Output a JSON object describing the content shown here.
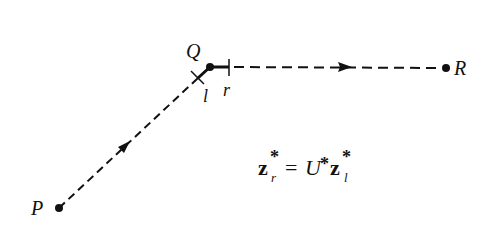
{
  "diagram": {
    "points": {
      "P": {
        "label": "P",
        "x": 59,
        "y": 208
      },
      "Q": {
        "label": "Q",
        "x": 210,
        "y": 67
      },
      "R": {
        "label": "R",
        "x": 446,
        "y": 68
      }
    },
    "marks": {
      "l": {
        "label": "l"
      },
      "r": {
        "label": "r"
      }
    },
    "equation": {
      "lhs_base": "z",
      "lhs_sup": "*",
      "lhs_sub": "r",
      "equals": "=",
      "operator": "U",
      "operator_sup": "*",
      "rhs_base": "z",
      "rhs_sup": "*",
      "rhs_sub": "l"
    },
    "colors": {
      "ink": "#111111",
      "background": "#ffffff"
    }
  }
}
